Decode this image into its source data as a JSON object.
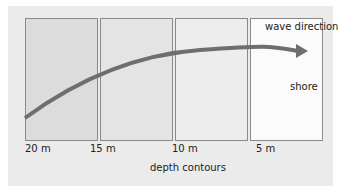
{
  "diagram": {
    "annotations": {
      "wave_direction": "wave direction",
      "shore": "shore"
    },
    "depth_contours": {
      "title": "depth contours",
      "ticks": [
        "20 m",
        "15 m",
        "10 m",
        "5 m"
      ]
    },
    "colors": {
      "background": "#ebebeb",
      "panel_deep": "#dcdcdc",
      "panel_mid1": "#e4e4e4",
      "panel_mid2": "#ededed",
      "panel_shore": "#fbfbfb",
      "arrow": "#6e6e6e",
      "border": "#8a8a8a"
    }
  }
}
